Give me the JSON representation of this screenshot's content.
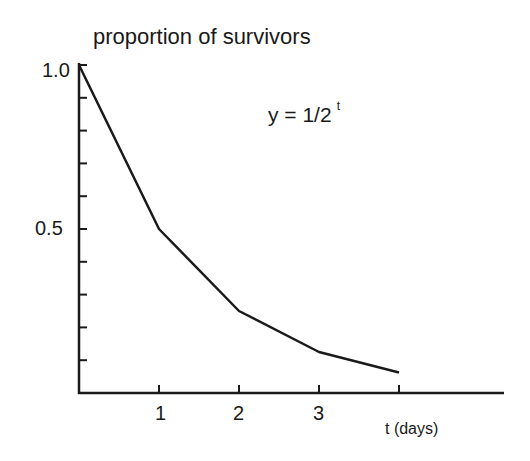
{
  "chart_data": {
    "type": "line",
    "title": "proportion of survivors",
    "annotation": {
      "base": "y = 1/2",
      "exponent": "t"
    },
    "xlabel": "t (days)",
    "ylabel": "proportion of survivors",
    "x": [
      0,
      1,
      2,
      3,
      4
    ],
    "values": [
      1.0,
      0.5,
      0.25,
      0.125,
      0.0625
    ],
    "series": [
      {
        "name": "y = 1/2^t",
        "x": [
          0,
          1,
          2,
          3,
          4
        ],
        "values": [
          1.0,
          0.5,
          0.25,
          0.125,
          0.0625
        ]
      }
    ],
    "xticks": [
      1,
      2,
      3,
      4
    ],
    "xtick_labels": [
      "1",
      "2",
      "3",
      ""
    ],
    "yticks": [
      0.1,
      0.2,
      0.3,
      0.4,
      0.5,
      0.6,
      0.7,
      0.8,
      0.9,
      1.0
    ],
    "ytick_labels": {
      "0.5": "0.5",
      "1.0": "1.0"
    },
    "xlim": [
      0,
      5.3
    ],
    "ylim": [
      0,
      1.0
    ],
    "grid": false,
    "legend": null
  },
  "labels": {
    "title": "proportion of survivors",
    "eq_base": "y = 1/2",
    "eq_exp": "t",
    "y_top": "1.0",
    "y_mid": "0.5",
    "x1": "1",
    "x2": "2",
    "x3": "3",
    "xlabel": "t (days)"
  }
}
